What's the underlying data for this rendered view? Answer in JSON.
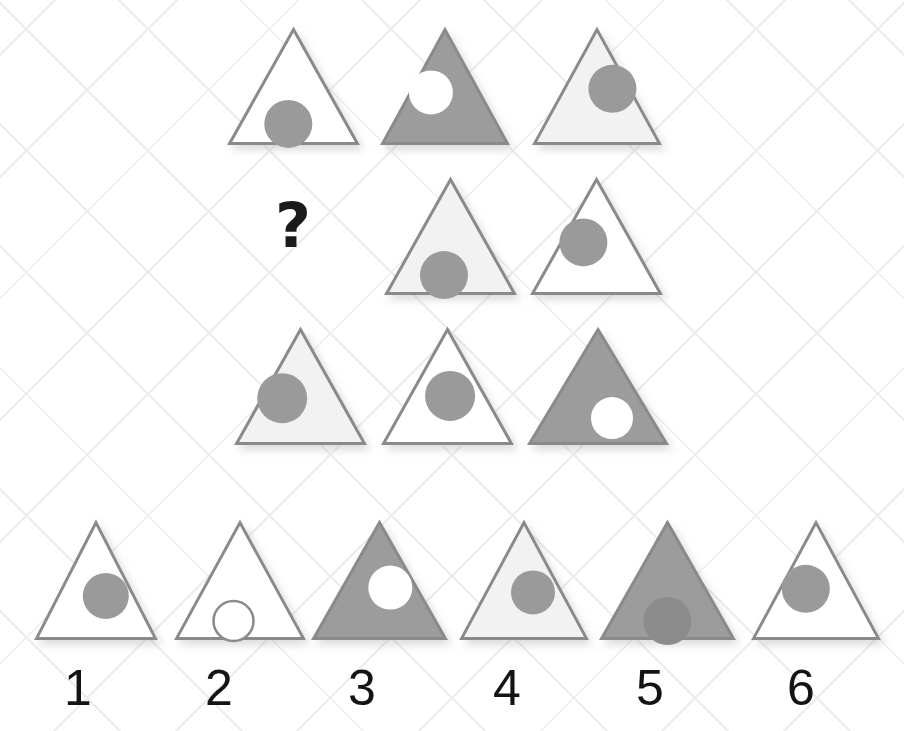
{
  "canvas": {
    "width": 904,
    "height": 731,
    "background": "#ffffff"
  },
  "background": {
    "name": "diamond-lattice-grid",
    "line_color": "#ededee"
  },
  "palette": {
    "outline": "#8a8a8c",
    "fill_white": "#ffffff",
    "fill_light_gray": "#f2f2f2",
    "fill_gray": "#9c9c9c",
    "circle_gray": "#9a9a9a",
    "circle_white": "#ffffff",
    "circle_dark_gray": "#8c8c8c",
    "text_dark": "#141414",
    "question_mark_color": "#1b1b1b"
  },
  "puzzle": {
    "type": "matrix-reasoning",
    "prompt_symbol": "?",
    "missing_cell": {
      "row": 2,
      "column": 1
    },
    "matrix": {
      "rows": 3,
      "columns": 3,
      "cells": [
        {
          "id": "cell-r1c1",
          "row": 1,
          "column": 1,
          "triangle_fill": "white",
          "triangle_fill_hex": "#ffffff",
          "circle_fill": "gray",
          "circle_fill_hex": "#9a9a9a",
          "circle_position": "bottom-center-left",
          "x": 228,
          "y": 28,
          "w": 131,
          "h": 117,
          "cx_pct": 0.46,
          "cy_pct": 0.82,
          "r": 24
        },
        {
          "id": "cell-r1c2",
          "row": 1,
          "column": 2,
          "triangle_fill": "gray",
          "triangle_fill_hex": "#9c9c9c",
          "circle_fill": "white",
          "circle_fill_hex": "#ffffff",
          "circle_position": "upper-left",
          "x": 381,
          "y": 28,
          "w": 128,
          "h": 117,
          "cx_pct": 0.39,
          "cy_pct": 0.55,
          "r": 22
        },
        {
          "id": "cell-r1c3",
          "row": 1,
          "column": 3,
          "triangle_fill": "light-gray",
          "triangle_fill_hex": "#f2f2f2",
          "circle_fill": "gray",
          "circle_fill_hex": "#9a9a9a",
          "circle_position": "upper-right",
          "x": 533,
          "y": 28,
          "w": 128,
          "h": 117,
          "cx_pct": 0.62,
          "cy_pct": 0.52,
          "r": 24
        },
        {
          "id": "cell-r2c1",
          "row": 2,
          "column": 1,
          "triangle_fill": "none",
          "triangle_fill_hex": "#ffffff",
          "circle_fill": "none",
          "circle_fill_hex": "#ffffff",
          "circle_position": "none",
          "x": 275,
          "y": 195,
          "w": 60,
          "h": 80,
          "cx_pct": 0,
          "cy_pct": 0,
          "r": 0
        },
        {
          "id": "cell-r2c2",
          "row": 2,
          "column": 2,
          "triangle_fill": "light-gray",
          "triangle_fill_hex": "#f2f2f2",
          "circle_fill": "gray",
          "circle_fill_hex": "#9a9a9a",
          "circle_position": "bottom-center-left",
          "x": 385,
          "y": 178,
          "w": 131,
          "h": 117,
          "cx_pct": 0.45,
          "cy_pct": 0.83,
          "r": 24
        },
        {
          "id": "cell-r2c3",
          "row": 2,
          "column": 3,
          "triangle_fill": "white",
          "triangle_fill_hex": "#ffffff",
          "circle_fill": "gray",
          "circle_fill_hex": "#9a9a9a",
          "circle_position": "upper-left",
          "x": 531,
          "y": 178,
          "w": 131,
          "h": 117,
          "cx_pct": 0.4,
          "cy_pct": 0.55,
          "r": 24
        },
        {
          "id": "cell-r3c1",
          "row": 3,
          "column": 1,
          "triangle_fill": "light-gray",
          "triangle_fill_hex": "#f2f2f2",
          "circle_fill": "gray",
          "circle_fill_hex": "#9a9a9a",
          "circle_position": "middle-left",
          "x": 235,
          "y": 328,
          "w": 131,
          "h": 117,
          "cx_pct": 0.36,
          "cy_pct": 0.6,
          "r": 25
        },
        {
          "id": "cell-r3c2",
          "row": 3,
          "column": 2,
          "triangle_fill": "white",
          "triangle_fill_hex": "#ffffff",
          "circle_fill": "gray",
          "circle_fill_hex": "#9a9a9a",
          "circle_position": "center",
          "x": 382,
          "y": 328,
          "w": 131,
          "h": 117,
          "cx_pct": 0.52,
          "cy_pct": 0.58,
          "r": 25
        },
        {
          "id": "cell-r3c3",
          "row": 3,
          "column": 3,
          "triangle_fill": "gray",
          "triangle_fill_hex": "#9c9c9c",
          "circle_fill": "white",
          "circle_fill_hex": "#ffffff",
          "circle_position": "lower-right",
          "x": 528,
          "y": 328,
          "w": 140,
          "h": 117,
          "cx_pct": 0.6,
          "cy_pct": 0.77,
          "r": 21
        }
      ]
    },
    "options": {
      "count": 6,
      "items": [
        {
          "id": "option-1",
          "label": "1",
          "triangle_fill": "white",
          "triangle_fill_hex": "#ffffff",
          "circle_fill": "gray",
          "circle_fill_hex": "#9a9a9a",
          "circle_outline": false,
          "circle_position": "middle-right",
          "x": 35,
          "y": 521,
          "w": 122,
          "h": 119,
          "cx_pct": 0.58,
          "cy_pct": 0.63,
          "r": 23,
          "label_x": 56,
          "label_y": 663
        },
        {
          "id": "option-2",
          "label": "2",
          "triangle_fill": "white",
          "triangle_fill_hex": "#ffffff",
          "circle_fill": "white",
          "circle_fill_hex": "#ffffff",
          "circle_outline": true,
          "circle_position": "bottom-center",
          "x": 175,
          "y": 521,
          "w": 130,
          "h": 119,
          "cx_pct": 0.45,
          "cy_pct": 0.84,
          "r": 20,
          "label_x": 197,
          "label_y": 663
        },
        {
          "id": "option-3",
          "label": "3",
          "triangle_fill": "gray",
          "triangle_fill_hex": "#9c9c9c",
          "circle_fill": "white",
          "circle_fill_hex": "#ffffff",
          "circle_outline": false,
          "circle_position": "upper-right",
          "x": 312,
          "y": 521,
          "w": 135,
          "h": 119,
          "cx_pct": 0.58,
          "cy_pct": 0.56,
          "r": 22,
          "label_x": 340,
          "label_y": 663
        },
        {
          "id": "option-4",
          "label": "4",
          "triangle_fill": "light-gray",
          "triangle_fill_hex": "#f2f2f2",
          "circle_fill": "gray",
          "circle_fill_hex": "#9a9a9a",
          "circle_outline": false,
          "circle_position": "middle-right",
          "x": 460,
          "y": 521,
          "w": 128,
          "h": 119,
          "cx_pct": 0.57,
          "cy_pct": 0.6,
          "r": 22,
          "label_x": 485,
          "label_y": 663
        },
        {
          "id": "option-5",
          "label": "5",
          "triangle_fill": "gray",
          "triangle_fill_hex": "#9c9c9c",
          "circle_fill": "dark-gray",
          "circle_fill_hex": "#8c8c8c",
          "circle_outline": false,
          "circle_position": "bottom-center",
          "x": 600,
          "y": 521,
          "w": 135,
          "h": 119,
          "cx_pct": 0.5,
          "cy_pct": 0.84,
          "r": 24,
          "label_x": 628,
          "label_y": 663
        },
        {
          "id": "option-6",
          "label": "6",
          "triangle_fill": "white",
          "triangle_fill_hex": "#ffffff",
          "circle_fill": "gray",
          "circle_fill_hex": "#9a9a9a",
          "circle_outline": false,
          "circle_position": "upper-left",
          "x": 752,
          "y": 521,
          "w": 128,
          "h": 119,
          "cx_pct": 0.42,
          "cy_pct": 0.57,
          "r": 24,
          "label_x": 779,
          "label_y": 663
        }
      ]
    }
  }
}
